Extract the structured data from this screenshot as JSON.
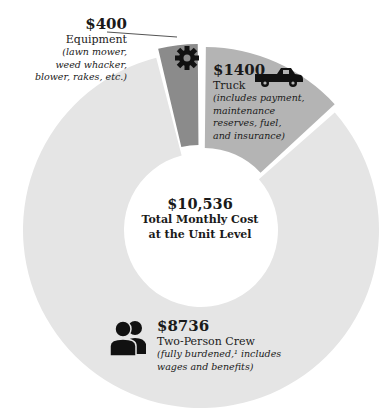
{
  "chart_data": {
    "type": "pie",
    "variant": "donut",
    "title": "Total Monthly Cost at the Unit Level",
    "total": 10536,
    "total_label": "$10,536",
    "categories": [
      "Two-Person Crew",
      "Truck",
      "Equipment"
    ],
    "values": [
      8736,
      1400,
      400
    ],
    "colors": [
      "#e5e5e5",
      "#b4b4b4",
      "#8b8b8b"
    ],
    "slices": [
      {
        "name": "Two-Person Crew",
        "value": 8736,
        "label": "$8736",
        "note": "(fully burdened,¹ includes wages and benefits)",
        "icon": "two-people-icon"
      },
      {
        "name": "Truck",
        "value": 1400,
        "label": "$1400",
        "note": "(includes payment, maintenance reserves, fuel, and insurance)",
        "icon": "pickup-truck-icon"
      },
      {
        "name": "Equipment",
        "value": 400,
        "label": "$400",
        "note": "(lawn mower, weed whacker, blower, rakes, etc.)",
        "icon": "gear-icon"
      }
    ],
    "legend": "none (inline labels)"
  },
  "labels": {
    "equipment": {
      "amount": "$400",
      "name": "Equipment",
      "note_lines": [
        "(lawn mower,",
        "weed whacker,",
        "blower, rakes, etc.)"
      ]
    },
    "truck": {
      "amount": "$1400",
      "name": "Truck",
      "note_lines": [
        "(includes payment,",
        "maintenance",
        "reserves, fuel,",
        "and insurance)"
      ]
    },
    "crew": {
      "amount": "$8736",
      "name": "Two-Person Crew",
      "note_lines": [
        "(fully burdened,¹ includes",
        "wages and benefits)"
      ]
    },
    "center": {
      "amount": "$10,536",
      "line1": "Total Monthly Cost",
      "line2": "at the Unit Level"
    }
  }
}
